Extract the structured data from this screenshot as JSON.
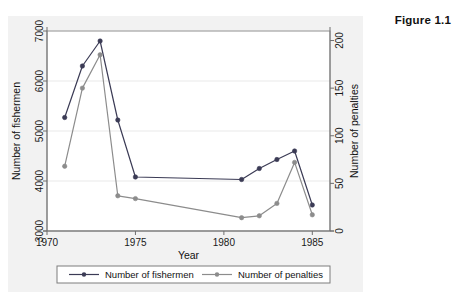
{
  "figure": {
    "caption": "Figure 1.1"
  },
  "chart_data": {
    "type": "line",
    "title": "",
    "xlabel": "Year",
    "ylabel": "Number of fishermen",
    "y2label": "Number of penalties",
    "xlim": [
      1970,
      1986
    ],
    "ylim": [
      3000,
      7000
    ],
    "y2lim": [
      0,
      210
    ],
    "xticks": [
      1970,
      1975,
      1980,
      1985
    ],
    "yticks": [
      3000,
      4000,
      5000,
      6000,
      7000
    ],
    "y2ticks": [
      0,
      50,
      100,
      150,
      200
    ],
    "grid": true,
    "legend_position": "bottom",
    "x": [
      1971,
      1972,
      1973,
      1974,
      1975,
      1981,
      1982,
      1983,
      1984,
      1985
    ],
    "series": [
      {
        "name": "Number of fishermen",
        "axis": "left",
        "color": "#3b3b55",
        "marker": "circle",
        "values": [
          5270,
          6300,
          6800,
          5220,
          4080,
          4030,
          4250,
          4430,
          4600,
          3520
        ]
      },
      {
        "name": "Number of penalties",
        "axis": "right",
        "color": "#8c8c8c",
        "marker": "circle",
        "values": [
          68,
          150,
          185,
          37,
          34,
          14,
          16,
          29,
          72,
          17
        ]
      }
    ],
    "legend": [
      {
        "label": "Number of fishermen",
        "color": "#3b3b55"
      },
      {
        "label": "Number of penalties",
        "color": "#8c8c8c"
      }
    ]
  }
}
